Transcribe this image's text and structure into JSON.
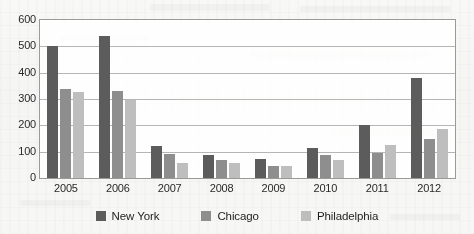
{
  "chart_data": {
    "type": "bar",
    "title": "",
    "subtitle": "",
    "xlabel": "",
    "ylabel": "",
    "categories": [
      "2005",
      "2006",
      "2007",
      "2008",
      "2009",
      "2010",
      "2011",
      "2012"
    ],
    "series": [
      {
        "name": "New York",
        "color": "#5c5c5c",
        "values": [
          500,
          540,
          120,
          88,
          73,
          115,
          203,
          380
        ]
      },
      {
        "name": "Chicago",
        "color": "#8e8e8e",
        "values": [
          338,
          330,
          92,
          68,
          45,
          86,
          96,
          148
        ]
      },
      {
        "name": "Philadelphia",
        "color": "#bdbdbd",
        "values": [
          328,
          298,
          58,
          58,
          44,
          70,
          126,
          186
        ]
      }
    ],
    "ylim": [
      0,
      600
    ],
    "yticks": [
      0,
      100,
      200,
      300,
      400,
      500,
      600
    ],
    "ytick_labels": [
      "0",
      "100",
      "200",
      "300",
      "400",
      "500",
      "600"
    ],
    "grid": true,
    "grid_axis": "y",
    "legend_position": "bottom",
    "plot_border": true,
    "background_color": "#f5f5f3"
  },
  "legend": {
    "items": [
      {
        "label": "New York",
        "color": "#5c5c5c",
        "swatch_name": "legend-swatch-new-york"
      },
      {
        "label": "Chicago",
        "color": "#8e8e8e",
        "swatch_name": "legend-swatch-chicago"
      },
      {
        "label": "Philadelphia",
        "color": "#bdbdbd",
        "swatch_name": "legend-swatch-philadelphia"
      }
    ]
  }
}
